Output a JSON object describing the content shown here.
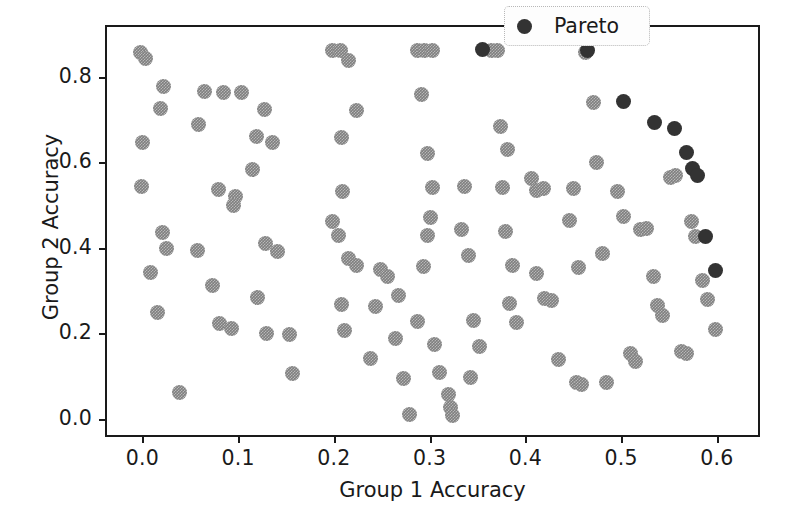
{
  "chart_data": {
    "type": "scatter",
    "title": "",
    "xlabel": "Group 1 Accuracy",
    "ylabel": "Group 2 Accuracy",
    "xlim": [
      -0.039,
      0.645
    ],
    "ylim": [
      -0.042,
      0.921
    ],
    "xticks": [
      0.0,
      0.1,
      0.2,
      0.3,
      0.4,
      0.5,
      0.6
    ],
    "xticklabels": [
      "0.0",
      "0.1",
      "0.2",
      "0.3",
      "0.4",
      "0.5",
      "0.6"
    ],
    "yticks": [
      0.0,
      0.2,
      0.4,
      0.6,
      0.8
    ],
    "yticklabels": [
      "0.0",
      "0.2",
      "0.4",
      "0.6",
      "0.8"
    ],
    "grid": false,
    "legend": {
      "position": "upper right",
      "entries": [
        {
          "label": "Pareto",
          "color": "#333333",
          "marker": "circle"
        }
      ]
    },
    "colors": {
      "point": "#7f7f7f",
      "pareto": "#333333",
      "axis": "#1a1a1a",
      "background": "#ffffff"
    },
    "series": [
      {
        "name": "models",
        "color": "#7f7f7f",
        "points": [
          [
            -0.004,
            0.862
          ],
          [
            0.001,
            0.847
          ],
          [
            0.02,
            0.783
          ],
          [
            0.017,
            0.731
          ],
          [
            -0.002,
            0.65
          ],
          [
            -0.003,
            0.549
          ],
          [
            0.019,
            0.441
          ],
          [
            0.023,
            0.404
          ],
          [
            0.006,
            0.347
          ],
          [
            0.014,
            0.254
          ],
          [
            0.037,
            0.066
          ],
          [
            0.063,
            0.771
          ],
          [
            0.083,
            0.768
          ],
          [
            0.057,
            0.694
          ],
          [
            0.077,
            0.541
          ],
          [
            0.095,
            0.524
          ],
          [
            0.093,
            0.503
          ],
          [
            0.055,
            0.398
          ],
          [
            0.071,
            0.316
          ],
          [
            0.078,
            0.227
          ],
          [
            0.091,
            0.216
          ],
          [
            0.101,
            0.767
          ],
          [
            0.125,
            0.729
          ],
          [
            0.117,
            0.665
          ],
          [
            0.134,
            0.65
          ],
          [
            0.113,
            0.589
          ],
          [
            0.127,
            0.414
          ],
          [
            0.139,
            0.396
          ],
          [
            0.118,
            0.289
          ],
          [
            0.128,
            0.205
          ],
          [
            0.152,
            0.203
          ],
          [
            0.155,
            0.11
          ],
          [
            0.196,
            0.866
          ],
          [
            0.205,
            0.866
          ],
          [
            0.213,
            0.843
          ],
          [
            0.206,
            0.662
          ],
          [
            0.222,
            0.726
          ],
          [
            0.207,
            0.536
          ],
          [
            0.196,
            0.466
          ],
          [
            0.203,
            0.434
          ],
          [
            0.213,
            0.381
          ],
          [
            0.222,
            0.364
          ],
          [
            0.206,
            0.272
          ],
          [
            0.209,
            0.211
          ],
          [
            0.236,
            0.146
          ],
          [
            0.241,
            0.268
          ],
          [
            0.247,
            0.355
          ],
          [
            0.254,
            0.337
          ],
          [
            0.265,
            0.293
          ],
          [
            0.262,
            0.193
          ],
          [
            0.271,
            0.099
          ],
          [
            0.277,
            0.016
          ],
          [
            0.285,
            0.866
          ],
          [
            0.293,
            0.866
          ],
          [
            0.301,
            0.866
          ],
          [
            0.289,
            0.763
          ],
          [
            0.296,
            0.625
          ],
          [
            0.301,
            0.546
          ],
          [
            0.299,
            0.475
          ],
          [
            0.296,
            0.434
          ],
          [
            0.291,
            0.361
          ],
          [
            0.285,
            0.232
          ],
          [
            0.303,
            0.178
          ],
          [
            0.308,
            0.114
          ],
          [
            0.318,
            0.062
          ],
          [
            0.32,
            0.031
          ],
          [
            0.322,
            0.012
          ],
          [
            0.334,
            0.549
          ],
          [
            0.331,
            0.448
          ],
          [
            0.338,
            0.387
          ],
          [
            0.344,
            0.234
          ],
          [
            0.35,
            0.175
          ],
          [
            0.341,
            0.101
          ],
          [
            0.363,
            0.866
          ],
          [
            0.369,
            0.866
          ],
          [
            0.372,
            0.688
          ],
          [
            0.379,
            0.634
          ],
          [
            0.374,
            0.546
          ],
          [
            0.377,
            0.444
          ],
          [
            0.384,
            0.363
          ],
          [
            0.381,
            0.275
          ],
          [
            0.389,
            0.231
          ],
          [
            0.404,
            0.568
          ],
          [
            0.409,
            0.54
          ],
          [
            0.417,
            0.544
          ],
          [
            0.41,
            0.346
          ],
          [
            0.418,
            0.286
          ],
          [
            0.425,
            0.281
          ],
          [
            0.432,
            0.143
          ],
          [
            0.448,
            0.544
          ],
          [
            0.444,
            0.469
          ],
          [
            0.453,
            0.359
          ],
          [
            0.451,
            0.09
          ],
          [
            0.457,
            0.085
          ],
          [
            0.461,
            0.862
          ],
          [
            0.469,
            0.744
          ],
          [
            0.472,
            0.604
          ],
          [
            0.478,
            0.392
          ],
          [
            0.483,
            0.089
          ],
          [
            0.494,
            0.537
          ],
          [
            0.5,
            0.479
          ],
          [
            0.508,
            0.158
          ],
          [
            0.513,
            0.139
          ],
          [
            0.518,
            0.448
          ],
          [
            0.524,
            0.451
          ],
          [
            0.532,
            0.337
          ],
          [
            0.536,
            0.269
          ],
          [
            0.541,
            0.247
          ],
          [
            0.549,
            0.57
          ],
          [
            0.555,
            0.575
          ],
          [
            0.561,
            0.163
          ],
          [
            0.566,
            0.158
          ],
          [
            0.571,
            0.466
          ],
          [
            0.576,
            0.431
          ],
          [
            0.583,
            0.329
          ],
          [
            0.588,
            0.283
          ],
          [
            0.596,
            0.213
          ]
        ]
      },
      {
        "name": "Pareto",
        "color": "#333333",
        "points": [
          [
            0.353,
            0.869
          ],
          [
            0.463,
            0.866
          ],
          [
            0.5,
            0.746
          ],
          [
            0.533,
            0.698
          ],
          [
            0.554,
            0.683
          ],
          [
            0.566,
            0.628
          ],
          [
            0.572,
            0.59
          ],
          [
            0.578,
            0.575
          ],
          [
            0.586,
            0.431
          ],
          [
            0.596,
            0.352
          ]
        ]
      }
    ]
  }
}
